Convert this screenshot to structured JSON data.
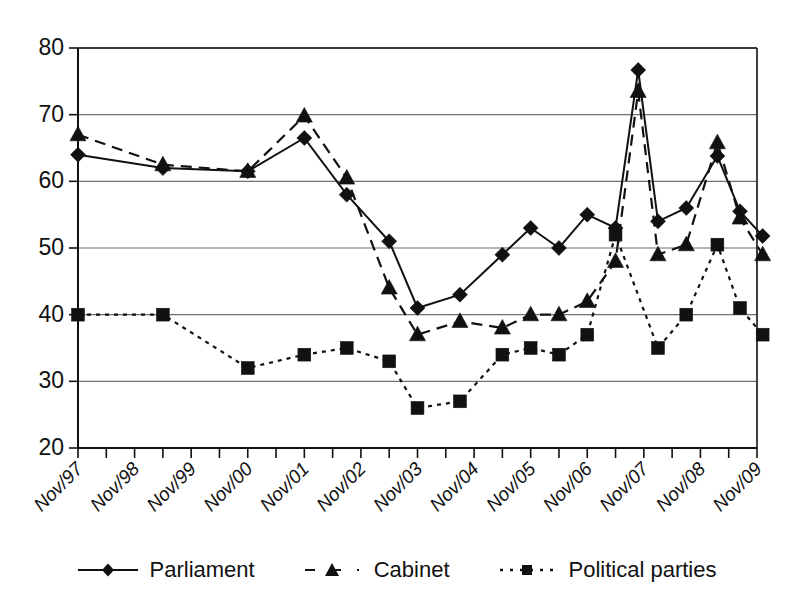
{
  "chart_data": {
    "type": "line",
    "title": "",
    "subtitle": "",
    "xlabel": "",
    "ylabel": "",
    "ylim": [
      20,
      80
    ],
    "ytick_step": 10,
    "yticks": [
      20,
      30,
      40,
      50,
      60,
      70,
      80
    ],
    "grid": "horizontal",
    "legend_position": "bottom",
    "x_tick_labels": [
      "Nov/97",
      "Nov/98",
      "Nov/99",
      "Nov/00",
      "Nov/01",
      "Nov/02",
      "Nov/03",
      "Nov/04",
      "Nov/05",
      "Nov/06",
      "Nov/07",
      "Nov/08",
      "Nov/09"
    ],
    "x": [
      0.0,
      1.5,
      3.0,
      4.0,
      4.75,
      5.5,
      6.0,
      6.75,
      7.5,
      8.0,
      8.5,
      9.0,
      9.5,
      9.9,
      10.25,
      10.75,
      11.3,
      11.7,
      12.1
    ],
    "series": [
      {
        "name": "Parliament",
        "marker": "diamond",
        "line_style": "solid",
        "color": "#111111",
        "values": [
          64,
          62,
          61.5,
          66.5,
          58,
          51,
          41,
          43,
          49,
          53,
          50,
          55,
          53,
          76.7,
          54,
          56,
          63.8,
          55.5,
          51.8
        ]
      },
      {
        "name": "Cabinet",
        "marker": "triangle",
        "line_style": "dashed",
        "color": "#111111",
        "values": [
          67,
          62.5,
          61.5,
          69.8,
          60.5,
          44,
          37,
          39,
          38,
          40,
          40,
          42,
          48,
          73.5,
          49,
          50.5,
          65.8,
          54.5,
          49
        ]
      },
      {
        "name": "Political parties",
        "marker": "square",
        "line_style": "dotted",
        "color": "#111111",
        "values": [
          40,
          40,
          32,
          34,
          35,
          33,
          26,
          27,
          34,
          35,
          34,
          37,
          52,
          35,
          40,
          50.5,
          41,
          37
        ],
        "x": [
          0.0,
          1.5,
          3.0,
          4.0,
          4.75,
          5.5,
          6.0,
          6.75,
          7.5,
          8.0,
          8.5,
          9.0,
          9.5,
          10.25,
          10.75,
          11.3,
          11.7,
          12.1
        ]
      }
    ]
  },
  "legend": {
    "entries": [
      {
        "label": "Parliament",
        "key": "solid-diamond"
      },
      {
        "label": "Cabinet",
        "key": "dashed-triangle"
      },
      {
        "label": "Political parties",
        "key": "dotted-square"
      }
    ]
  },
  "colors": {
    "ink": "#111111",
    "grid": "#6f6f6f",
    "background": "#ffffff"
  }
}
